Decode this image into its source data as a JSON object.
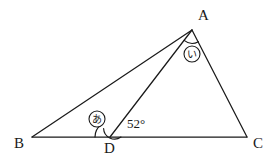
{
  "figure": {
    "type": "geometry-diagram",
    "canvas": {
      "width": 276,
      "height": 162
    },
    "stroke_color": "#1a1a1a",
    "background_color": "#ffffff"
  },
  "points": {
    "A": {
      "label": "A",
      "x": 192,
      "y": 30,
      "label_x": 198,
      "label_y": 8
    },
    "B": {
      "label": "B",
      "x": 32,
      "y": 137,
      "label_x": 14,
      "label_y": 136
    },
    "C": {
      "label": "C",
      "x": 247,
      "y": 137,
      "label_x": 253,
      "label_y": 136
    },
    "D": {
      "label": "D",
      "x": 110,
      "y": 137,
      "label_x": 104,
      "label_y": 141
    }
  },
  "segments": [
    {
      "name": "BC",
      "from": "B",
      "to": "C"
    },
    {
      "name": "BA",
      "from": "B",
      "to": "A"
    },
    {
      "name": "AC",
      "from": "A",
      "to": "C"
    },
    {
      "name": "AD",
      "from": "A",
      "to": "D"
    }
  ],
  "angles": {
    "adb": {
      "name": "angle-ADB",
      "vertex": "D",
      "mark": "あ",
      "mark_label_x": 88,
      "mark_label_y": 110,
      "arc_radius": 15
    },
    "adc": {
      "name": "angle-ADC",
      "vertex": "D",
      "value": "52°",
      "label_x": 127,
      "label_y": 117,
      "arc_radius": 11
    },
    "dac": {
      "name": "angle-DAC",
      "vertex": "A",
      "mark": "い",
      "mark_label_x": 183,
      "mark_label_y": 45,
      "arc_radius": 13
    }
  },
  "labels": {
    "vertex_a": "A",
    "vertex_b": "B",
    "vertex_c": "C",
    "vertex_d": "D",
    "angle_52": "52°",
    "mark_a_kana": "あ",
    "mark_i_kana": "い"
  }
}
